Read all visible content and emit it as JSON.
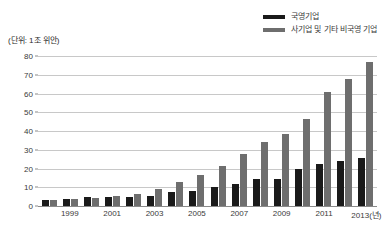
{
  "unit_caption": "(단위: 1조 위안)",
  "legend": {
    "items": [
      {
        "label": "국영기업",
        "color": "#1a1a1a",
        "key": "state"
      },
      {
        "label": "사기업 및 기타 비국영 기업",
        "color": "#6e6e6e",
        "key": "private"
      }
    ]
  },
  "axis": {
    "y_ticks": [
      "80",
      "70",
      "60",
      "50",
      "40",
      "30",
      "20",
      "10",
      "0"
    ],
    "x_tick_labels": [
      "1999",
      "2001",
      "2003",
      "2005",
      "2007",
      "2009",
      "2011",
      "2013(년)"
    ]
  },
  "colors": {
    "state_bar": "#1a1a1a",
    "private_bar": "#6e6e6e",
    "gridline": "#c8c8c8",
    "axis": "#8a8a8a",
    "text": "#3a3a3a",
    "background": "#ffffff"
  },
  "chart_data": {
    "type": "bar",
    "title": "",
    "subtitle": "",
    "xlabel": "년",
    "ylabel": "1조 위안",
    "ylim": [
      0,
      80
    ],
    "ytick_step": 10,
    "grid": true,
    "legend_position": "top-right",
    "categories": [
      "1998",
      "1999",
      "2000",
      "2001",
      "2002",
      "2003",
      "2004",
      "2005",
      "2006",
      "2007",
      "2008",
      "2009",
      "2010",
      "2011",
      "2012",
      "2013"
    ],
    "labeled_categories": [
      "1999",
      "2001",
      "2003",
      "2005",
      "2007",
      "2009",
      "2011",
      "2013"
    ],
    "series": [
      {
        "name": "국영기업",
        "color": "#1a1a1a",
        "values": [
          3.2,
          3.6,
          4.6,
          4.6,
          4.6,
          5.4,
          7.3,
          8.0,
          10.0,
          12.0,
          14.4,
          14.5,
          19.6,
          22.6,
          24.2,
          25.7
        ]
      },
      {
        "name": "사기업 및 기타 비국영 기업",
        "color": "#6e6e6e",
        "values": [
          3.1,
          3.5,
          4.2,
          5.3,
          6.6,
          9.3,
          12.8,
          16.6,
          21.3,
          27.5,
          34.2,
          38.5,
          46.6,
          60.8,
          67.5,
          76.6
        ]
      }
    ]
  }
}
